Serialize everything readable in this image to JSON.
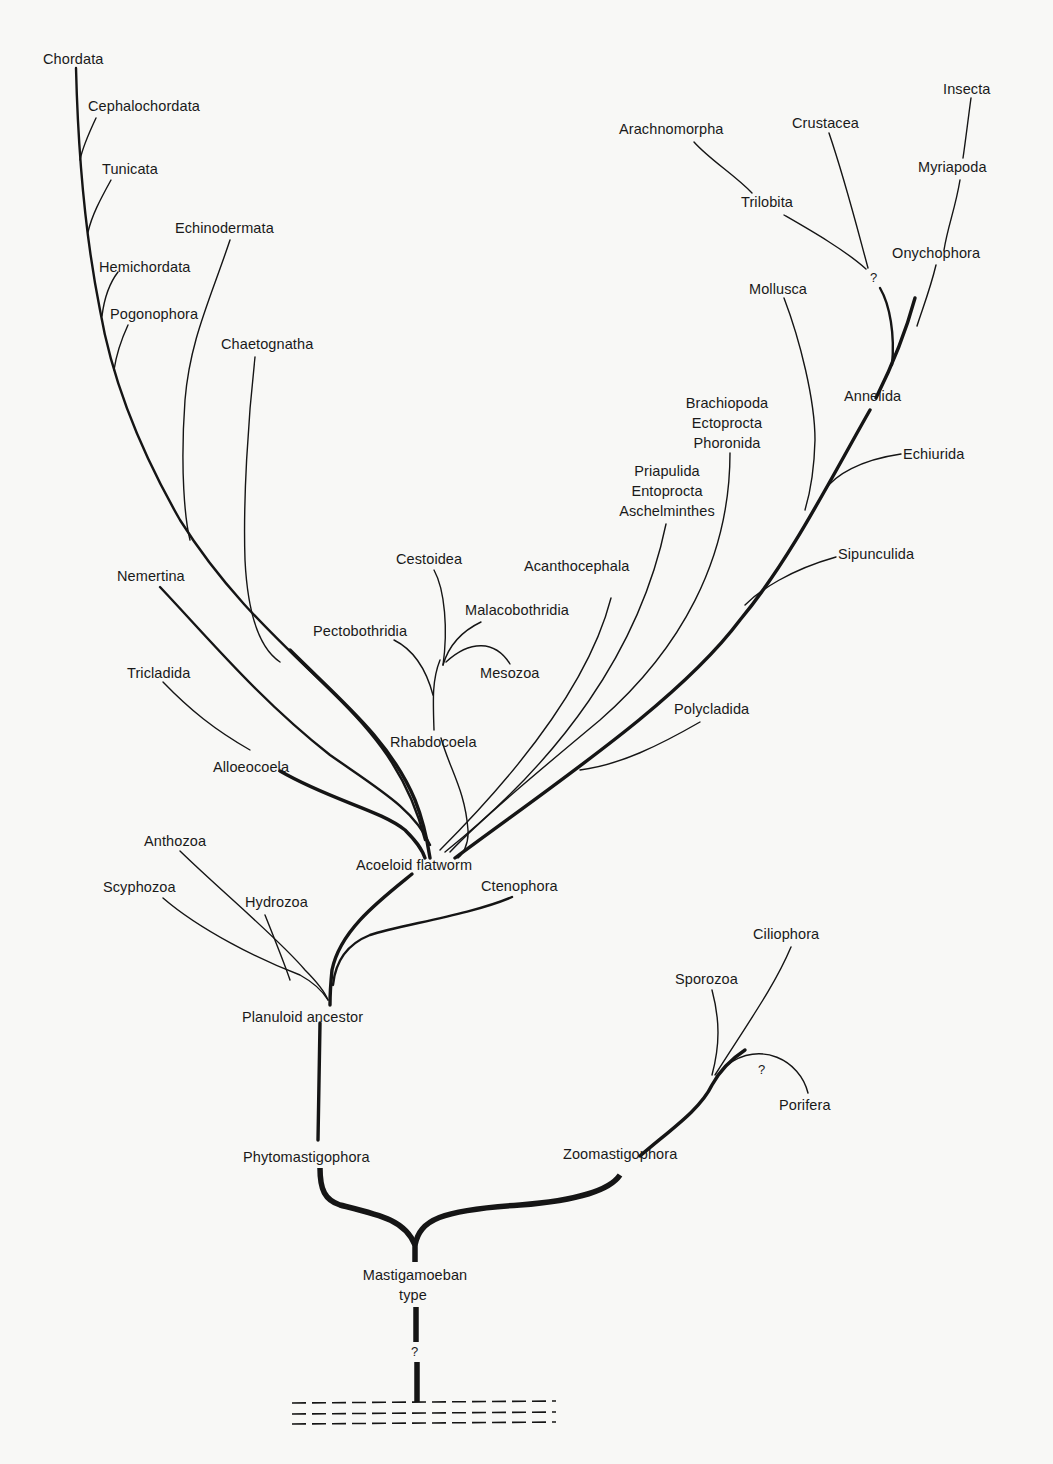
{
  "diagram": {
    "type": "phylogenetic-tree",
    "root": "Mastigamoeban type",
    "uncertain_marker": "?"
  },
  "labels": {
    "chordata": "Chordata",
    "cephalochordata": "Cephalochordata",
    "tunicata": "Tunicata",
    "echinodermata": "Echinodermata",
    "hemichordata": "Hemichordata",
    "pogonophora": "Pogonophora",
    "chaetognatha": "Chaetognatha",
    "nemertina": "Nemertina",
    "tricladida": "Tricladida",
    "alloeocoela": "Alloeocoela",
    "cestoidea": "Cestoidea",
    "malacobothridia": "Malacobothridia",
    "pectobothridia": "Pectobothridia",
    "mesozoa": "Mesozoa",
    "rhabdocoela": "Rhabdocoela",
    "acanthocephala": "Acanthocephala",
    "priapulida_group": [
      "Priapulida",
      "Entoprocta",
      "Aschelminthes"
    ],
    "brachiopoda_group": [
      "Brachiopoda",
      "Ectoprocta",
      "Phoronida"
    ],
    "arachnomorpha": "Arachnomorpha",
    "crustacea": "Crustacea",
    "insecta": "Insecta",
    "myriapoda": "Myriapoda",
    "trilobita": "Trilobita",
    "onychophora": "Onychophora",
    "mollusca": "Mollusca",
    "annelida": "Annelida",
    "echiurida": "Echiurida",
    "sipunculida": "Sipunculida",
    "polycladida": "Polycladida",
    "acoeloid_flatworm": "Acoeloid flatworm",
    "anthozoa": "Anthozoa",
    "scyphozoa": "Scyphozoa",
    "hydrozoa": "Hydrozoa",
    "ctenophora": "Ctenophora",
    "planuloid_ancestor": "Planuloid ancestor",
    "ciliophora": "Ciliophora",
    "sporozoa": "Sporozoa",
    "porifera": "Porifera",
    "phytomastigophora": "Phytomastigophora",
    "zoomastigophora": "Zoomastigophora",
    "mastigamoeban": [
      "Mastigamoeban",
      "type"
    ],
    "q_arthropod": "?",
    "q_porifera": "?",
    "q_root": "?"
  }
}
